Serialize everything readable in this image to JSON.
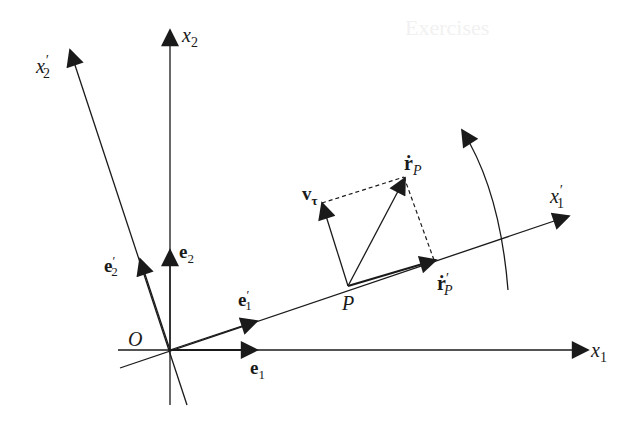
{
  "diagram": {
    "title_ghost": "Exercises",
    "colors": {
      "ink": "#1a1a1a",
      "background": "#ffffff"
    },
    "labels": {
      "x1": "x",
      "x1_sub": "1",
      "x2": "x",
      "x2_sub": "2",
      "x1p": "x",
      "x1p_prime": "′",
      "x1p_sub": "1",
      "x2p": "x",
      "x2p_prime": "′",
      "x2p_sub": "2",
      "origin": "O",
      "e1": "e",
      "e1_sub": "1",
      "e2": "e",
      "e2_sub": "2",
      "e1p": "e",
      "e1p_prime": "′",
      "e1p_sub": "1",
      "e2p": "e",
      "e2p_prime": "′",
      "e2p_sub": "2",
      "point": "P",
      "rdot": "ṙ",
      "rdot_sub": "P",
      "rdotp": "ṙ",
      "rdotp_prime": "′",
      "rdotp_sub": "P",
      "vtau": "v",
      "vtau_sub": "τ"
    }
  }
}
